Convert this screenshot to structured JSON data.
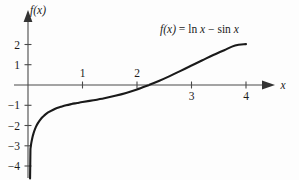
{
  "figure": {
    "background_color": "#fdfdfd",
    "curve_color": "#1a1a1a",
    "axis_color": "#4a4a4a",
    "text_color": "#1b1b1b"
  },
  "labels": {
    "y_axis": "f(x)",
    "x_axis": "x",
    "equation_fx": "f(x)",
    "equation_equals": "=",
    "equation_ln": "ln",
    "equation_x1": "x",
    "equation_minus": "−",
    "equation_sin": "sin",
    "equation_x2": "x",
    "equation_full": "f(x) = ln x − sin x"
  },
  "axes": {
    "x_ticks": [
      {
        "label": "1",
        "value": 1,
        "label_side": "above"
      },
      {
        "label": "2",
        "value": 2,
        "label_side": "above"
      },
      {
        "label": "3",
        "value": 3,
        "label_side": "below"
      },
      {
        "label": "4",
        "value": 4,
        "label_side": "below"
      }
    ],
    "y_ticks": [
      {
        "label": "2",
        "value": 2
      },
      {
        "label": "1",
        "value": 1
      },
      {
        "label": "−1",
        "value": -1
      },
      {
        "label": "−2",
        "value": -2
      },
      {
        "label": "−3",
        "value": -3
      },
      {
        "label": "−4",
        "value": -4
      }
    ]
  },
  "chart_data": {
    "type": "line",
    "title": "",
    "xlabel": "x",
    "ylabel": "f(x)",
    "annotation": "f(x) = ln x − sin x",
    "annotation_position": "upper-right",
    "legend": "none",
    "grid": false,
    "xlim": [
      0,
      4.45
    ],
    "ylim": [
      -4.6,
      2.6
    ],
    "xticks": [
      1,
      2,
      3,
      4
    ],
    "yticks": [
      2,
      1,
      -1,
      -2,
      -3,
      -4
    ],
    "x_zero_crossing": 2.22,
    "asymptote": "vertical asymptote at x = 0",
    "series": [
      {
        "name": "f(x) = ln x - sin x",
        "x": [
          0.045,
          0.06,
          0.08,
          0.1,
          0.13,
          0.16,
          0.2,
          0.25,
          0.3,
          0.35,
          0.4,
          0.5,
          0.6,
          0.7,
          0.8,
          0.9,
          1.0,
          1.2,
          1.4,
          1.6,
          1.8,
          2.0,
          2.2,
          2.22,
          2.4,
          2.6,
          2.8,
          3.0,
          3.2,
          3.4,
          3.6,
          3.8,
          4.0
        ],
        "y": [
          -3.15,
          -2.87,
          -2.6,
          -2.4,
          -2.17,
          -1.99,
          -1.81,
          -1.63,
          -1.5,
          -1.39,
          -1.31,
          -1.17,
          -1.08,
          -1.0,
          -0.94,
          -0.89,
          -0.84,
          -0.75,
          -0.65,
          -0.53,
          -0.39,
          -0.22,
          -0.02,
          0.0,
          0.2,
          0.44,
          0.7,
          0.96,
          1.22,
          1.48,
          1.72,
          1.95,
          2.02
        ]
      }
    ]
  }
}
